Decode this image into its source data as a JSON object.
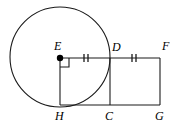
{
  "figure": {
    "type": "geometry-diagram",
    "stroke_color": "#1a1a1a",
    "background_color": "#ffffff",
    "circle": {
      "name": "circle-E",
      "center_label": "E",
      "center": {
        "x": 60,
        "y": 57
      },
      "radius": 50
    },
    "points": [
      {
        "id": "E",
        "label": "E",
        "x": 60,
        "y": 58,
        "label_x": 54,
        "label_y": 40,
        "marker": "filled-dot"
      },
      {
        "id": "D",
        "label": "D",
        "x": 110,
        "y": 58,
        "label_x": 112,
        "label_y": 41,
        "marker": "none"
      },
      {
        "id": "F",
        "label": "F",
        "x": 160,
        "y": 58,
        "label_x": 162,
        "label_y": 40,
        "marker": "none"
      },
      {
        "id": "H",
        "label": "H",
        "x": 60,
        "y": 105,
        "label_x": 55,
        "label_y": 110,
        "marker": "none"
      },
      {
        "id": "C",
        "label": "C",
        "x": 110,
        "y": 105,
        "label_x": 105,
        "label_y": 110,
        "marker": "none"
      },
      {
        "id": "G",
        "label": "G",
        "x": 160,
        "y": 105,
        "label_x": 155,
        "label_y": 110,
        "marker": "none"
      }
    ],
    "segments": [
      {
        "id": "EF",
        "from": "E",
        "to": "F",
        "x1": 60,
        "y1": 58,
        "x2": 160,
        "y2": 58
      },
      {
        "id": "HG",
        "from": "H",
        "to": "G",
        "x1": 60,
        "y1": 105,
        "x2": 160,
        "y2": 105
      },
      {
        "id": "EH",
        "from": "E",
        "to": "H",
        "x1": 60,
        "y1": 58,
        "x2": 60,
        "y2": 105
      },
      {
        "id": "DC",
        "from": "D",
        "to": "C",
        "x1": 110,
        "y1": 58,
        "x2": 110,
        "y2": 105
      },
      {
        "id": "FG",
        "from": "F",
        "to": "G",
        "x1": 160,
        "y1": 58,
        "x2": 160,
        "y2": 105
      }
    ],
    "tick_marks": [
      {
        "id": "ticks-ED",
        "on_segment": "ED",
        "count": 2,
        "x_positions": [
          84,
          88
        ],
        "y_center": 58,
        "half_height": 4
      },
      {
        "id": "ticks-DF",
        "on_segment": "DF",
        "count": 2,
        "x_positions": [
          132,
          136
        ],
        "y_center": 58,
        "half_height": 4
      }
    ],
    "right_angle_marker": {
      "id": "right-angle-E",
      "at_point": "E",
      "x": 60,
      "y": 58,
      "size": 9
    }
  }
}
